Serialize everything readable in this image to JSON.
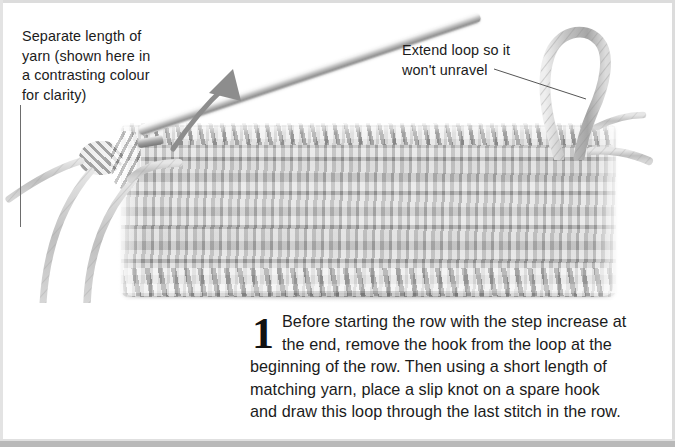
{
  "page": {
    "width": 675,
    "height": 447,
    "background_color": "#ffffff",
    "border_color": "#dcdcdc",
    "bottom_border_color": "#b9b9b9"
  },
  "callouts": [
    {
      "id": "separate-length-of-yarn",
      "text": "Separate length of\nyarn (shown here in\na contrasting colour\nfor clarity)",
      "leader": "vertical-line"
    },
    {
      "id": "extend-loop",
      "text": "Extend loop so it\nwon't unravel",
      "leader": "diagonal-line"
    }
  ],
  "photo": {
    "subject": "crochet-swatch",
    "yarn_color": "#bdbdbd",
    "hook_color": "#b6b6b6",
    "arrow_color": "#8d8d8d",
    "parts": [
      "crochet-swatch",
      "crochet-hook",
      "extended-loop",
      "slip-knot",
      "yarn-strands",
      "direction-arrow"
    ]
  },
  "step": {
    "number": "1",
    "lines": [
      "Before starting the row with the step increase at",
      "the end, remove the hook from the loop at the",
      "beginning of the row. Then using a short length of",
      "matching yarn, place a slip knot on a spare hook",
      "and draw this loop through the last stitch in the row."
    ],
    "text": "Before starting the row with the step increase at the end, remove the hook from the loop at the beginning of the row. Then using a short length of matching yarn, place a slip knot on a spare hook and draw this loop through the last stitch in the row."
  }
}
